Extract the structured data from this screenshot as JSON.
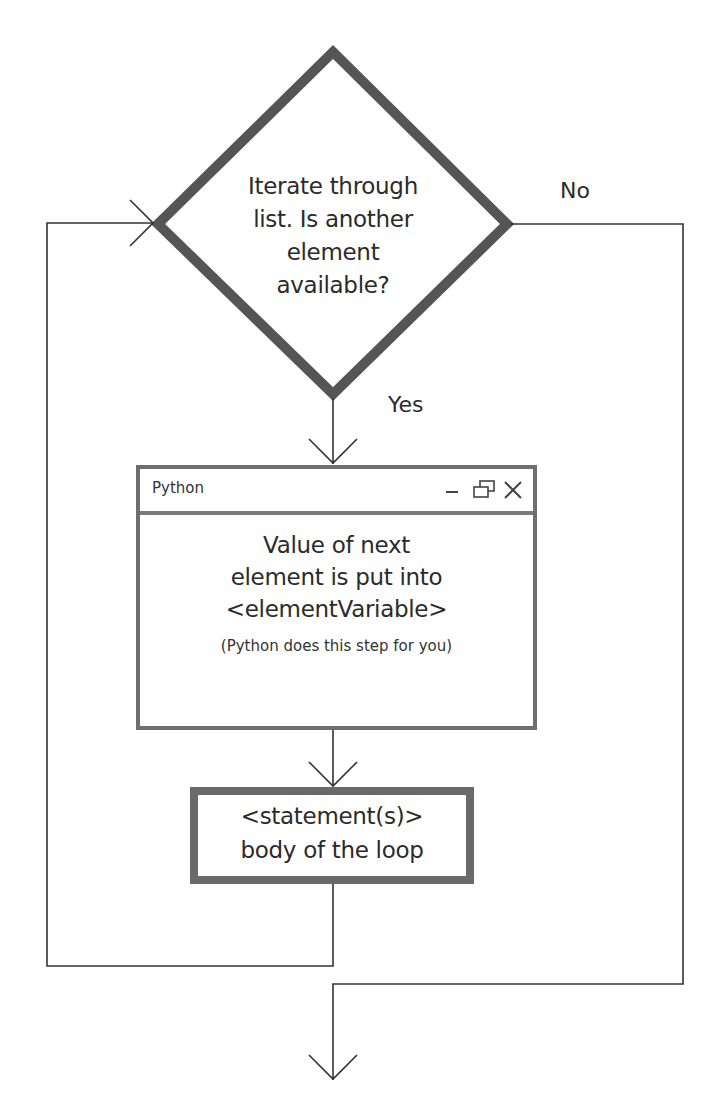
{
  "diagram": {
    "type": "flowchart",
    "decision": {
      "lines": [
        "Iterate through",
        "list. Is another",
        "element",
        "available?"
      ]
    },
    "branches": {
      "no_label": "No",
      "yes_label": "Yes"
    },
    "python_window": {
      "title": "Python",
      "controls": [
        {
          "name": "minimize",
          "icon": "minimize-icon",
          "glyph": "–"
        },
        {
          "name": "restore",
          "icon": "restore-icon",
          "glyph": "⧉"
        },
        {
          "name": "close",
          "icon": "close-icon",
          "glyph": "✕"
        }
      ],
      "body_lines": [
        "Value of next",
        "element is put into",
        "<elementVariable>"
      ],
      "note": "(Python does this step for you)"
    },
    "statement_box": {
      "lines": [
        "<statement(s)>",
        "body of the loop"
      ]
    },
    "colors": {
      "diamond_stroke": "#555555",
      "window_border": "#6e6e6e",
      "statement_border": "#6a6a6a",
      "connector": "#333333",
      "text": "#2b2b2b",
      "background": "#ffffff"
    }
  }
}
